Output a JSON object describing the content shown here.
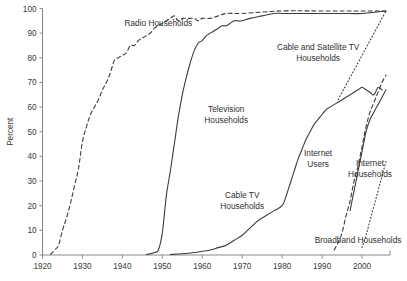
{
  "chart_data": {
    "type": "line",
    "title": "",
    "subtitle": "",
    "xlabel": "",
    "ylabel": "Percent",
    "xlim": [
      1920,
      2007
    ],
    "ylim": [
      0,
      100
    ],
    "grid": false,
    "legend_position": "inline-annotations",
    "x_ticks": [
      1920,
      1930,
      1940,
      1950,
      1960,
      1970,
      1980,
      1990,
      2000
    ],
    "x_tick_labels": [
      "1920",
      "1930",
      "1940",
      "1950",
      "1960",
      "1970",
      "1980",
      "1990",
      "2000"
    ],
    "y_ticks": [
      0,
      10,
      20,
      30,
      40,
      50,
      60,
      70,
      80,
      90,
      100
    ],
    "y_tick_labels": [
      "0",
      "10",
      "20",
      "30",
      "40",
      "50",
      "60",
      "70",
      "80",
      "90",
      "100"
    ],
    "series": [
      {
        "name": "Radio Households",
        "style": "dashed",
        "label_x": 1949,
        "label_y": 93,
        "label_anchor": "middle",
        "points": [
          [
            1922,
            0.2
          ],
          [
            1923,
            2
          ],
          [
            1924,
            4
          ],
          [
            1925,
            10
          ],
          [
            1926,
            15
          ],
          [
            1927,
            21
          ],
          [
            1928,
            28
          ],
          [
            1929,
            35
          ],
          [
            1930,
            46
          ],
          [
            1931,
            52
          ],
          [
            1932,
            57
          ],
          [
            1933,
            60
          ],
          [
            1934,
            63
          ],
          [
            1935,
            67
          ],
          [
            1936,
            70
          ],
          [
            1937,
            74
          ],
          [
            1938,
            79
          ],
          [
            1939,
            80
          ],
          [
            1940,
            81
          ],
          [
            1941,
            82
          ],
          [
            1942,
            85
          ],
          [
            1943,
            85
          ],
          [
            1944,
            87
          ],
          [
            1945,
            88
          ],
          [
            1946,
            89
          ],
          [
            1947,
            90
          ],
          [
            1948,
            92
          ],
          [
            1949,
            93
          ],
          [
            1950,
            94
          ],
          [
            1951,
            95
          ],
          [
            1952,
            96
          ],
          [
            1953,
            97
          ],
          [
            1954,
            95
          ],
          [
            1955,
            96
          ],
          [
            1956,
            96
          ],
          [
            1957,
            96
          ],
          [
            1958,
            96
          ],
          [
            1959,
            95
          ],
          [
            1960,
            96
          ],
          [
            1962,
            96
          ],
          [
            1964,
            97
          ],
          [
            1966,
            98
          ],
          [
            1970,
            98
          ],
          [
            1980,
            99
          ],
          [
            1990,
            99
          ],
          [
            2000,
            99
          ],
          [
            2006,
            99
          ]
        ]
      },
      {
        "name": "Television Households",
        "style": "solid",
        "label_x": 1966,
        "label_y": 58,
        "label_anchor": "middle",
        "points": [
          [
            1946,
            0.2
          ],
          [
            1947,
            0.5
          ],
          [
            1948,
            1
          ],
          [
            1949,
            2
          ],
          [
            1950,
            9
          ],
          [
            1951,
            24
          ],
          [
            1952,
            34
          ],
          [
            1953,
            45
          ],
          [
            1954,
            56
          ],
          [
            1955,
            65
          ],
          [
            1956,
            72
          ],
          [
            1957,
            78
          ],
          [
            1958,
            83
          ],
          [
            1959,
            86
          ],
          [
            1960,
            87
          ],
          [
            1961,
            89
          ],
          [
            1962,
            90
          ],
          [
            1963,
            91
          ],
          [
            1964,
            92
          ],
          [
            1965,
            93
          ],
          [
            1966,
            93
          ],
          [
            1967,
            94
          ],
          [
            1968,
            95
          ],
          [
            1969,
            95
          ],
          [
            1970,
            95
          ],
          [
            1972,
            96
          ],
          [
            1975,
            97
          ],
          [
            1978,
            98
          ],
          [
            1980,
            98
          ],
          [
            1985,
            98
          ],
          [
            1990,
            98
          ],
          [
            1995,
            98
          ],
          [
            2000,
            98
          ],
          [
            2006,
            99
          ]
        ]
      },
      {
        "name": "Cable TV Households",
        "style": "solid",
        "label_x": 1970,
        "label_y": 23,
        "label_anchor": "middle",
        "points": [
          [
            1952,
            0.2
          ],
          [
            1955,
            0.5
          ],
          [
            1958,
            1
          ],
          [
            1960,
            1.5
          ],
          [
            1962,
            2
          ],
          [
            1964,
            3
          ],
          [
            1966,
            4
          ],
          [
            1968,
            6
          ],
          [
            1970,
            8
          ],
          [
            1972,
            11
          ],
          [
            1974,
            14
          ],
          [
            1976,
            16
          ],
          [
            1978,
            18
          ],
          [
            1980,
            20
          ],
          [
            1981,
            24
          ],
          [
            1982,
            29
          ],
          [
            1983,
            34
          ],
          [
            1984,
            39
          ],
          [
            1985,
            43
          ],
          [
            1986,
            47
          ],
          [
            1987,
            50
          ],
          [
            1988,
            53
          ],
          [
            1989,
            55
          ],
          [
            1990,
            57
          ],
          [
            1991,
            59
          ],
          [
            1992,
            60
          ],
          [
            1993,
            61
          ],
          [
            1994,
            62
          ],
          [
            1995,
            63
          ],
          [
            1996,
            64
          ],
          [
            1997,
            65
          ],
          [
            1998,
            66
          ],
          [
            1999,
            67
          ],
          [
            2000,
            68
          ],
          [
            2001,
            67
          ],
          [
            2002,
            66
          ],
          [
            2003,
            65
          ],
          [
            2004,
            68
          ],
          [
            2005,
            67
          ]
        ]
      },
      {
        "name": "Cable and Satellite TV Households",
        "style": "dotted",
        "label_x": 1989,
        "label_y": 83,
        "label_anchor": "middle",
        "points": [
          [
            1994,
            63
          ],
          [
            1995,
            66
          ],
          [
            1996,
            69
          ],
          [
            1997,
            72
          ],
          [
            1998,
            75
          ],
          [
            1999,
            78
          ],
          [
            2000,
            81
          ],
          [
            2001,
            84
          ],
          [
            2002,
            87
          ],
          [
            2003,
            90
          ],
          [
            2004,
            93
          ],
          [
            2005,
            96
          ],
          [
            2006,
            99
          ]
        ]
      },
      {
        "name": "Internet Users",
        "style": "dashed",
        "label_x": 1989,
        "label_y": 40,
        "label_anchor": "middle",
        "points": [
          [
            1993,
            2
          ],
          [
            1994,
            5
          ],
          [
            1995,
            9
          ],
          [
            1996,
            16
          ],
          [
            1997,
            22
          ],
          [
            1998,
            30
          ],
          [
            1999,
            36
          ],
          [
            2000,
            44
          ],
          [
            2001,
            52
          ],
          [
            2002,
            58
          ],
          [
            2003,
            62
          ],
          [
            2004,
            66
          ],
          [
            2005,
            70
          ],
          [
            2006,
            73
          ]
        ]
      },
      {
        "name": "Internet Households",
        "style": "solid",
        "label_x": 2002,
        "label_y": 36,
        "label_anchor": "middle",
        "points": [
          [
            1997,
            18
          ],
          [
            1998,
            26
          ],
          [
            1999,
            34
          ],
          [
            2000,
            42
          ],
          [
            2001,
            50
          ],
          [
            2002,
            55
          ],
          [
            2003,
            58
          ],
          [
            2004,
            61
          ],
          [
            2005,
            64
          ],
          [
            2006,
            67
          ]
        ]
      },
      {
        "name": "Broadband Households",
        "style": "dotted",
        "label_x": 1999,
        "label_y": 5,
        "label_anchor": "middle",
        "points": [
          [
            2000,
            3
          ],
          [
            2001,
            8
          ],
          [
            2002,
            14
          ],
          [
            2003,
            20
          ],
          [
            2004,
            26
          ],
          [
            2005,
            32
          ],
          [
            2006,
            38
          ]
        ]
      }
    ]
  },
  "axes": {
    "y_axis_title": "Percent"
  }
}
